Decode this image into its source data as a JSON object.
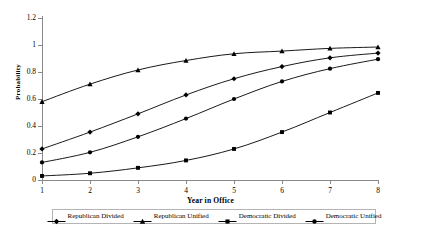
{
  "chart_data": {
    "type": "line",
    "title": "",
    "xlabel": "Year in Office",
    "ylabel": "Probability",
    "x": [
      1,
      2,
      3,
      4,
      5,
      6,
      7,
      8
    ],
    "xticklabels": [
      "1",
      "2",
      "3",
      "4",
      "5",
      "6",
      "7",
      "8"
    ],
    "xlim": [
      1,
      8
    ],
    "yticks": [
      0,
      0.2,
      0.4,
      0.6,
      0.8,
      1,
      1.2
    ],
    "yticklabels": [
      "0",
      "0.2",
      "0.4",
      "0.6",
      "0.8",
      "1",
      "1.2"
    ],
    "ylim": [
      0,
      1.2
    ],
    "grid": false,
    "legend_position": "bottom",
    "series": [
      {
        "name": "Republican Divided",
        "marker": "diamond",
        "color": "#000000",
        "values": [
          0.23,
          0.355,
          0.49,
          0.63,
          0.75,
          0.84,
          0.905,
          0.94
        ]
      },
      {
        "name": "Republican Unified",
        "marker": "triangle",
        "color": "#000000",
        "values": [
          0.58,
          0.71,
          0.815,
          0.885,
          0.935,
          0.955,
          0.975,
          0.985
        ]
      },
      {
        "name": "Democratic Divided",
        "marker": "square",
        "color": "#000000",
        "values": [
          0.03,
          0.05,
          0.09,
          0.145,
          0.23,
          0.355,
          0.5,
          0.645
        ]
      },
      {
        "name": "Democratic Unified",
        "marker": "circle",
        "color": "#000000",
        "values": [
          0.13,
          0.205,
          0.32,
          0.455,
          0.6,
          0.73,
          0.825,
          0.895
        ]
      }
    ]
  },
  "axes": {
    "y_title": "Probability",
    "x_title": "Year in Office"
  },
  "legend": {
    "entries": [
      {
        "label": "Republican Divided",
        "marker": "diamond"
      },
      {
        "label": "Republican Unified",
        "marker": "triangle"
      },
      {
        "label": "Democratic Divided",
        "marker": "square"
      },
      {
        "label": "Democratic Unified",
        "marker": "circle"
      }
    ]
  },
  "colors": {
    "line": "#000000",
    "axis": "#8a8a8a",
    "background": "#ffffff",
    "legend_border": "#b4b4b4"
  }
}
